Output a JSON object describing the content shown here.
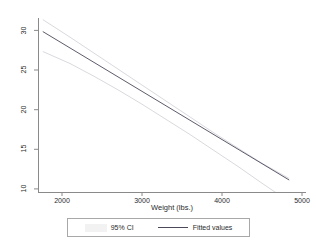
{
  "chart_data": {
    "type": "line",
    "title": "",
    "subtitle": "",
    "xlabel": "Weight (lbs.)",
    "ylabel": "",
    "xlim": [
      1700,
      5050
    ],
    "ylim": [
      8.8,
      30.6
    ],
    "xticks": [
      2000,
      3000,
      4000,
      5000
    ],
    "xtick_labels": [
      "2000",
      "3000",
      "4000",
      "5000"
    ],
    "yticks": [
      10,
      15,
      20,
      25,
      30
    ],
    "ytick_labels": [
      "10",
      "15",
      "20",
      "25",
      "30"
    ],
    "grid": false,
    "legend_position": "bottom",
    "series": [
      {
        "name": "95% CI",
        "type": "band",
        "color": "#cfcfd6",
        "x": [
          1760,
          2100,
          2400,
          2700,
          3000,
          3300,
          3600,
          3900,
          4200,
          4500,
          4840
        ],
        "lower": [
          26.4,
          24.9,
          23.3,
          21.6,
          19.8,
          17.9,
          16.0,
          14.0,
          12.0,
          9.9,
          7.6
        ],
        "upper": [
          30.4,
          28.2,
          26.2,
          24.2,
          22.2,
          20.2,
          18.2,
          16.2,
          14.3,
          12.4,
          10.5
        ]
      },
      {
        "name": "Fitted values",
        "type": "line",
        "color": "#4a4a5a",
        "x": [
          1760,
          4840
        ],
        "y": [
          28.9,
          10.3
        ]
      }
    ],
    "legend_entries": [
      {
        "label": "95% CI",
        "key": "band",
        "color": "#cfcfd6"
      },
      {
        "label": "Fitted values",
        "key": "line",
        "color": "#4a4a5a"
      }
    ]
  },
  "axes": {
    "y_labels": [
      "30",
      "25",
      "20",
      "15",
      "10"
    ],
    "x_labels": [
      "2000",
      "3000",
      "4000",
      "5000"
    ],
    "x_title": "Weight (lbs.)"
  },
  "legend": {
    "ci_label": "95% CI",
    "fit_label": "Fitted values"
  },
  "colors": {
    "axis": "#8a8a8a",
    "text": "#2b2b2b",
    "fit_line": "#4a4a5a",
    "ci_line": "#cfcfd6",
    "background": "#ffffff",
    "legend_border": "#a8a8a8"
  }
}
